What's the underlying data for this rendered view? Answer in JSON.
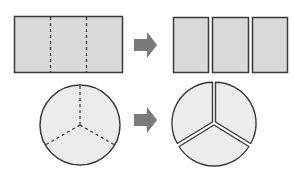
{
  "diagram": {
    "colors": {
      "background": "#ffffff",
      "rect_fill": "#d9d9d9",
      "circle_fill": "#ececec",
      "stroke": "#3a3a3a",
      "arrow": "#7a7a7a"
    },
    "rows": [
      {
        "before": {
          "shape": "rectangle",
          "divisions": 3,
          "division_style": "dashed"
        },
        "arrow": "right-arrow",
        "after": {
          "shape": "rectangle-pieces",
          "pieces": 3
        }
      },
      {
        "before": {
          "shape": "circle",
          "divisions": 3,
          "division_style": "dashed"
        },
        "arrow": "right-arrow",
        "after": {
          "shape": "circle-sectors",
          "pieces": 3
        }
      }
    ]
  }
}
